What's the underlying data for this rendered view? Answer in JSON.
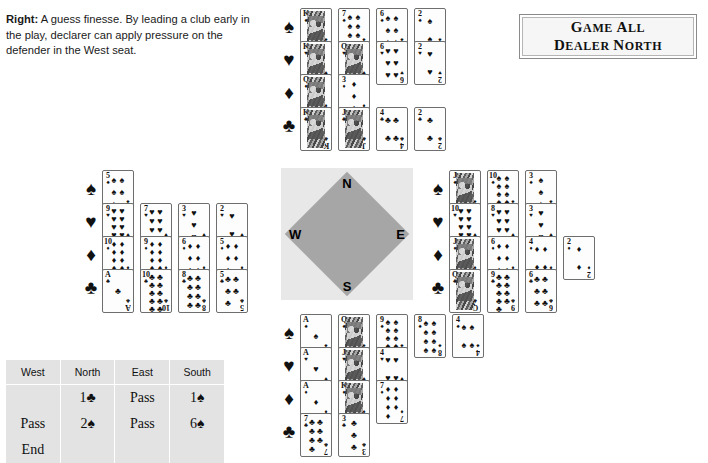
{
  "caption": {
    "lead": "Right:",
    "text": " A guess finesse. By leading a club early in the play, declarer can apply pressure on the defender in the West seat."
  },
  "vulnerability_box": {
    "line1": "Game All",
    "line2": "Dealer North"
  },
  "compass": {
    "north": "N",
    "south": "S",
    "west": "W",
    "east": "E"
  },
  "suit_symbols": {
    "spade": "♠",
    "heart": "♥",
    "diamond": "♦",
    "club": "♣"
  },
  "hands": {
    "north": {
      "label": "North",
      "spades": [
        "K",
        "7",
        "6",
        "2"
      ],
      "hearts": [
        "K",
        "Q",
        "6",
        "2"
      ],
      "diamonds": [
        "Q",
        "3"
      ],
      "clubs": [
        "K",
        "J",
        "4",
        "2"
      ]
    },
    "west": {
      "label": "West",
      "spades": [
        "5"
      ],
      "hearts": [
        "9",
        "7",
        "3",
        "2"
      ],
      "diamonds": [
        "10",
        "9",
        "6",
        "5"
      ],
      "clubs": [
        "A",
        "10",
        "8",
        "5"
      ]
    },
    "east": {
      "label": "East",
      "spades": [
        "J",
        "10",
        "3"
      ],
      "hearts": [
        "10",
        "8",
        "3"
      ],
      "diamonds": [
        "J",
        "6",
        "4",
        "2"
      ],
      "clubs": [
        "Q",
        "9",
        "6"
      ]
    },
    "south": {
      "label": "South",
      "spades": [
        "A",
        "Q",
        "9",
        "8",
        "4"
      ],
      "hearts": [
        "A",
        "J",
        "4"
      ],
      "diamonds": [
        "A",
        "K",
        "7"
      ],
      "clubs": [
        "7",
        "3"
      ]
    }
  },
  "bidding": {
    "headers": [
      "West",
      "North",
      "East",
      "South"
    ],
    "rows": [
      [
        "",
        "1♣",
        "Pass",
        "1♠"
      ],
      [
        "Pass",
        "2♠",
        "Pass",
        "6♠"
      ],
      [
        "End",
        "",
        "",
        ""
      ]
    ]
  },
  "colors": {
    "page_background": "#ffffff",
    "compass_outer": "#e8e8e8",
    "compass_inner": "#a6a6a6",
    "table_background": "#e3e3e3",
    "card_face": "#fdfdfd",
    "card_border": "#6e6e6e",
    "ink": "#111111"
  }
}
